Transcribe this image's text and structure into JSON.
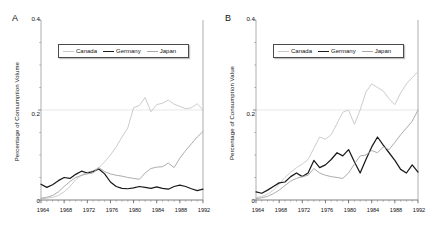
{
  "figure": {
    "panels": [
      {
        "letter": "A",
        "ylabel": "Percentage of Consumption Volume",
        "yticks": [
          "0",
          "0.2",
          "0.4"
        ],
        "xticks": [
          "1964",
          "1968",
          "1972",
          "1976",
          "1980",
          "1984",
          "1988",
          "1992"
        ],
        "legend": [
          {
            "label": "Canada",
            "color": "#c9c9c9"
          },
          {
            "label": "Germany",
            "color": "#1a1a1a"
          },
          {
            "label": "Japan",
            "color": "#a8a8a8"
          }
        ]
      },
      {
        "letter": "B",
        "ylabel": "Percentage of Consumption Value",
        "yticks": [
          "0",
          "0.2",
          "0.4"
        ],
        "xticks": [
          "1964",
          "1968",
          "1972",
          "1976",
          "1980",
          "1984",
          "1988",
          "1992"
        ],
        "legend": [
          {
            "label": "Canada",
            "color": "#c9c9c9"
          },
          {
            "label": "Germany",
            "color": "#1a1a1a"
          },
          {
            "label": "Japan",
            "color": "#a8a8a8"
          }
        ]
      }
    ]
  },
  "chart_data": [
    {
      "type": "line",
      "title": "",
      "panel": "A",
      "xlabel": "",
      "ylabel": "Percentage of Consumption Volume",
      "xlim": [
        1964,
        1992
      ],
      "ylim": [
        0,
        0.4
      ],
      "yticks": [
        0,
        0.2,
        0.4
      ],
      "xticks": [
        1964,
        1968,
        1972,
        1976,
        1980,
        1984,
        1988,
        1992
      ],
      "grid": "horizontal-at-0.2",
      "legend_position": "top-center",
      "x": [
        1964,
        1965,
        1966,
        1967,
        1968,
        1969,
        1970,
        1971,
        1972,
        1973,
        1974,
        1975,
        1976,
        1977,
        1978,
        1979,
        1980,
        1981,
        1982,
        1983,
        1984,
        1985,
        1986,
        1987,
        1988,
        1989,
        1990,
        1991,
        1992
      ],
      "series": [
        {
          "name": "Canada",
          "color": "#c9c9c9",
          "values": [
            0.003,
            0.004,
            0.006,
            0.01,
            0.018,
            0.03,
            0.045,
            0.055,
            0.062,
            0.065,
            0.072,
            0.085,
            0.1,
            0.118,
            0.14,
            0.16,
            0.205,
            0.21,
            0.228,
            0.196,
            0.212,
            0.215,
            0.222,
            0.213,
            0.208,
            0.203,
            0.205,
            0.214,
            0.2
          ]
        },
        {
          "name": "Germany",
          "color": "#1a1a1a",
          "values": [
            0.035,
            0.028,
            0.034,
            0.043,
            0.05,
            0.048,
            0.057,
            0.064,
            0.06,
            0.063,
            0.069,
            0.058,
            0.04,
            0.03,
            0.026,
            0.025,
            0.027,
            0.03,
            0.028,
            0.026,
            0.029,
            0.026,
            0.024,
            0.03,
            0.033,
            0.03,
            0.025,
            0.021,
            0.024
          ]
        },
        {
          "name": "Japan",
          "color": "#a8a8a8",
          "values": [
            0.004,
            0.006,
            0.01,
            0.018,
            0.03,
            0.041,
            0.05,
            0.055,
            0.058,
            0.06,
            0.072,
            0.063,
            0.058,
            0.055,
            0.053,
            0.05,
            0.048,
            0.046,
            0.06,
            0.07,
            0.073,
            0.074,
            0.082,
            0.072,
            0.093,
            0.11,
            0.125,
            0.14,
            0.152
          ]
        }
      ]
    },
    {
      "type": "line",
      "title": "",
      "panel": "B",
      "xlabel": "",
      "ylabel": "Percentage of Consumption Value",
      "xlim": [
        1964,
        1992
      ],
      "ylim": [
        0,
        0.4
      ],
      "yticks": [
        0,
        0.2,
        0.4
      ],
      "xticks": [
        1964,
        1968,
        1972,
        1976,
        1980,
        1984,
        1988,
        1992
      ],
      "grid": "horizontal-at-0.2",
      "legend_position": "top-center",
      "x": [
        1964,
        1965,
        1966,
        1967,
        1968,
        1969,
        1970,
        1971,
        1972,
        1973,
        1974,
        1975,
        1976,
        1977,
        1978,
        1979,
        1980,
        1981,
        1982,
        1983,
        1984,
        1985,
        1986,
        1987,
        1988,
        1989,
        1990,
        1991,
        1992
      ],
      "series": [
        {
          "name": "Canada",
          "color": "#c9c9c9",
          "values": [
            0.005,
            0.008,
            0.013,
            0.022,
            0.035,
            0.05,
            0.062,
            0.072,
            0.08,
            0.09,
            0.115,
            0.14,
            0.135,
            0.145,
            0.17,
            0.195,
            0.2,
            0.168,
            0.2,
            0.24,
            0.258,
            0.25,
            0.242,
            0.225,
            0.212,
            0.238,
            0.258,
            0.272,
            0.285
          ]
        },
        {
          "name": "Germany",
          "color": "#1a1a1a",
          "values": [
            0.018,
            0.015,
            0.022,
            0.03,
            0.038,
            0.04,
            0.052,
            0.06,
            0.052,
            0.06,
            0.088,
            0.072,
            0.078,
            0.09,
            0.105,
            0.098,
            0.112,
            0.085,
            0.06,
            0.09,
            0.118,
            0.14,
            0.122,
            0.105,
            0.088,
            0.068,
            0.06,
            0.078,
            0.062
          ]
        },
        {
          "name": "Japan",
          "color": "#a8a8a8",
          "values": [
            0.003,
            0.005,
            0.008,
            0.014,
            0.022,
            0.032,
            0.042,
            0.048,
            0.052,
            0.055,
            0.07,
            0.06,
            0.055,
            0.052,
            0.05,
            0.048,
            0.06,
            0.08,
            0.098,
            0.1,
            0.11,
            0.105,
            0.118,
            0.112,
            0.128,
            0.145,
            0.16,
            0.175,
            0.2
          ]
        }
      ]
    }
  ]
}
